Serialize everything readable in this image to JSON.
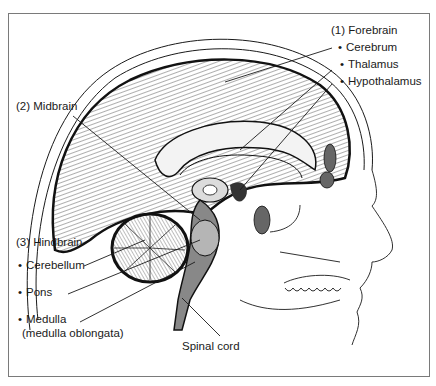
{
  "figure": {
    "type": "sagittal-brain-diagram",
    "line_color": "#1a1a1a",
    "frame_color": "#7a7a7a"
  },
  "labels": {
    "forebrain": {
      "heading": "(1) Forebrain",
      "items": [
        "Cerebrum",
        "Thalamus",
        "Hypothalamus"
      ]
    },
    "midbrain": {
      "heading": "(2) Midbrain"
    },
    "hindbrain": {
      "heading": "(3) Hindbrain",
      "items": [
        "Cerebellum",
        "Pons",
        "Medulla"
      ],
      "medulla_note": "(medulla oblongata)"
    },
    "spinal_cord": "Spinal cord"
  }
}
